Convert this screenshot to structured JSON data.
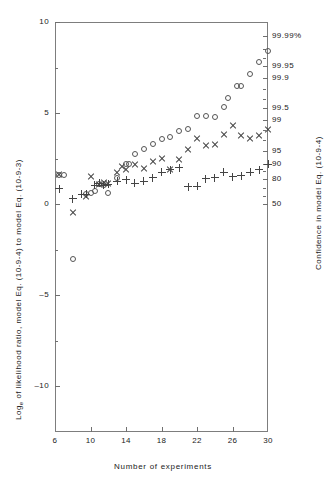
{
  "chart_data": {
    "type": "scatter",
    "title": "",
    "xlabel": "Number of experiments",
    "ylabel": "Log_e of likelihood ratio, model Eq. (10-9-4) to model Eq. (10-9-3)",
    "ylabel_right": "Confidence in model Eq. (10-9-4)",
    "xlim": [
      6,
      30
    ],
    "ylim": [
      -12.5,
      10
    ],
    "grid": false,
    "legend": "none",
    "xticks": [
      6,
      10,
      14,
      18,
      22,
      26,
      30
    ],
    "xticklabels": [
      "6",
      "10",
      "14",
      "18",
      "22",
      "26",
      "30"
    ],
    "yticks": [
      -10,
      -5,
      0,
      5,
      10
    ],
    "yticklabels": [
      "-10",
      "-5",
      "0",
      "5",
      "10"
    ],
    "yticks_minor": [
      -7.5,
      -2.5,
      2.5,
      7.5
    ],
    "right_axis": {
      "label": "Confidence in model Eq. (10-9-4)",
      "ticks": [
        {
          "value": 9.21,
          "label": "99.99%"
        },
        {
          "value": 7.6,
          "label": "99.95"
        },
        {
          "value": 6.91,
          "label": "99.9"
        },
        {
          "value": 5.29,
          "label": "99.5"
        },
        {
          "value": 4.6,
          "label": "99"
        },
        {
          "value": 2.94,
          "label": "95"
        },
        {
          "value": 2.2,
          "label": "90"
        },
        {
          "value": 1.39,
          "label": "80"
        },
        {
          "value": 0.0,
          "label": "50"
        }
      ],
      "minor_ticks": [
        8.5,
        8.0,
        6.3,
        5.8,
        4.1,
        3.5,
        1.8,
        0.9,
        0.45
      ]
    },
    "series": [
      {
        "name": "circles",
        "marker": "circle",
        "points": [
          [
            6.5,
            1.6
          ],
          [
            7.0,
            1.6
          ],
          [
            8.0,
            -3.0
          ],
          [
            9.5,
            0.55
          ],
          [
            10.0,
            0.6
          ],
          [
            10.5,
            0.75
          ],
          [
            11.0,
            1.1
          ],
          [
            11.5,
            1.05
          ],
          [
            12.0,
            0.6
          ],
          [
            13.0,
            1.45
          ],
          [
            14.0,
            2.2
          ],
          [
            14.3,
            2.2
          ],
          [
            15.0,
            2.75
          ],
          [
            16.0,
            3.05
          ],
          [
            17.0,
            3.3
          ],
          [
            18.0,
            3.6
          ],
          [
            19.0,
            3.7
          ],
          [
            20.0,
            4.0
          ],
          [
            21.0,
            4.15
          ],
          [
            22.0,
            4.85
          ],
          [
            23.0,
            4.85
          ],
          [
            24.0,
            4.8
          ],
          [
            25.0,
            5.35
          ],
          [
            25.5,
            5.85
          ],
          [
            26.5,
            6.5
          ],
          [
            27.0,
            6.5
          ],
          [
            28.0,
            7.15
          ],
          [
            29.0,
            7.8
          ],
          [
            30.0,
            8.4
          ]
        ]
      },
      {
        "name": "crosses",
        "marker": "cross",
        "points": [
          [
            6.5,
            1.65
          ],
          [
            8.0,
            -0.45
          ],
          [
            9.5,
            0.4
          ],
          [
            10.0,
            1.5
          ],
          [
            11.0,
            1.1
          ],
          [
            11.5,
            1.2
          ],
          [
            12.0,
            1.15
          ],
          [
            13.0,
            1.75
          ],
          [
            13.5,
            2.05
          ],
          [
            14.0,
            1.9
          ],
          [
            15.0,
            2.2
          ],
          [
            16.0,
            1.95
          ],
          [
            17.0,
            2.35
          ],
          [
            18.0,
            2.5
          ],
          [
            19.0,
            1.9
          ],
          [
            20.0,
            2.45
          ],
          [
            21.0,
            3.0
          ],
          [
            22.0,
            3.6
          ],
          [
            23.0,
            3.2
          ],
          [
            24.0,
            3.3
          ],
          [
            25.0,
            3.8
          ],
          [
            26.0,
            4.3
          ],
          [
            27.0,
            3.75
          ],
          [
            28.0,
            3.6
          ],
          [
            29.0,
            3.75
          ],
          [
            30.0,
            4.1
          ]
        ]
      },
      {
        "name": "plus",
        "marker": "plus",
        "points": [
          [
            6.5,
            0.85
          ],
          [
            8.0,
            0.3
          ],
          [
            9.0,
            0.55
          ],
          [
            9.5,
            0.55
          ],
          [
            10.5,
            1.05
          ],
          [
            11.0,
            1.15
          ],
          [
            11.5,
            1.05
          ],
          [
            12.0,
            1.1
          ],
          [
            13.0,
            1.25
          ],
          [
            14.0,
            1.35
          ],
          [
            15.0,
            1.15
          ],
          [
            16.0,
            1.25
          ],
          [
            17.0,
            1.45
          ],
          [
            18.0,
            1.75
          ],
          [
            19.0,
            1.9
          ],
          [
            20.0,
            2.0
          ],
          [
            21.0,
            0.95
          ],
          [
            22.0,
            1.0
          ],
          [
            23.0,
            1.4
          ],
          [
            24.0,
            1.45
          ],
          [
            25.0,
            1.75
          ],
          [
            26.0,
            1.5
          ],
          [
            27.0,
            1.55
          ],
          [
            28.0,
            1.75
          ],
          [
            29.0,
            1.9
          ],
          [
            30.0,
            2.2
          ]
        ]
      }
    ]
  },
  "axis": {
    "left_title_main": "Log",
    "left_title_sub": "e",
    "left_title_rest": " of likelihood ratio, model Eq. (10-9-4) to model Eq. (10-9-3)",
    "right_title": "Confidence in model Eq. (10-9-4)",
    "x_title": "Number of experiments"
  }
}
